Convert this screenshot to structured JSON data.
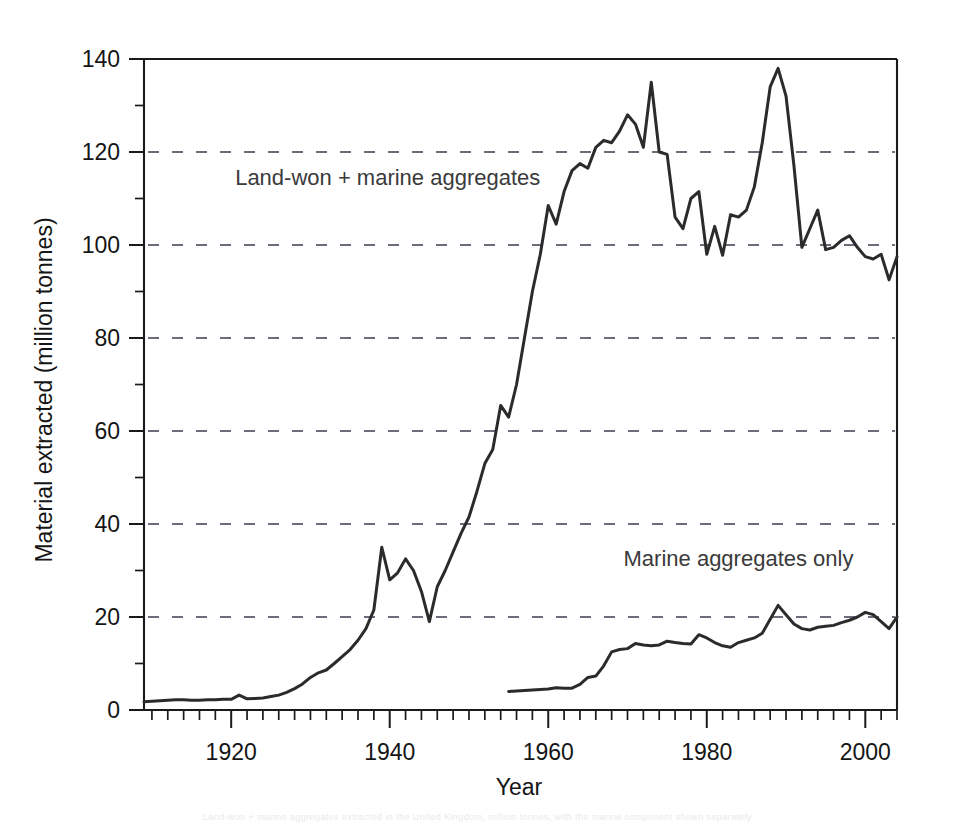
{
  "chart_data": {
    "type": "line",
    "title": "",
    "xlabel": "Year",
    "ylabel": "Material extracted (million tonnes)",
    "xlim": [
      1909,
      2004
    ],
    "ylim": [
      0,
      140
    ],
    "xticks": [
      1920,
      1940,
      1960,
      1980,
      2000
    ],
    "xtick_labels": [
      "1920",
      "1940",
      "1960",
      "1980",
      "2000"
    ],
    "xtick_minor_step": 2,
    "yticks": [
      0,
      20,
      40,
      60,
      80,
      100,
      120,
      140
    ],
    "ytick_labels": [
      "0",
      "20",
      "40",
      "60",
      "80",
      "100",
      "120",
      "140"
    ],
    "ytick_minor_step": 10,
    "grid": "horizontal-dashed",
    "gridlines_at": [
      20,
      40,
      60,
      80,
      100,
      120
    ],
    "legend": "inline-annotations",
    "annotations": [
      {
        "text": "Land-won + marine aggregates",
        "x": 1920.5,
        "y": 113
      },
      {
        "text": "Marine aggregates only",
        "x": 1969.5,
        "y": 31
      }
    ],
    "series": [
      {
        "name": "Land-won + marine aggregates",
        "color": "#2b2b2b",
        "x": [
          1909,
          1910,
          1911,
          1912,
          1913,
          1914,
          1915,
          1916,
          1917,
          1918,
          1919,
          1920,
          1921,
          1922,
          1923,
          1924,
          1925,
          1926,
          1927,
          1928,
          1929,
          1930,
          1931,
          1932,
          1933,
          1934,
          1935,
          1936,
          1937,
          1938,
          1939,
          1940,
          1941,
          1942,
          1943,
          1944,
          1945,
          1946,
          1947,
          1948,
          1949,
          1950,
          1951,
          1952,
          1953,
          1954,
          1955,
          1956,
          1957,
          1958,
          1959,
          1960,
          1961,
          1962,
          1963,
          1964,
          1965,
          1966,
          1967,
          1968,
          1969,
          1970,
          1971,
          1972,
          1973,
          1974,
          1975,
          1976,
          1977,
          1978,
          1979,
          1980,
          1981,
          1982,
          1983,
          1984,
          1985,
          1986,
          1987,
          1988,
          1989,
          1990,
          1991,
          1992,
          1993,
          1994,
          1995,
          1996,
          1997,
          1998,
          1999,
          2000,
          2001,
          2002,
          2003,
          2004
        ],
        "y": [
          1.8,
          1.9,
          2.0,
          2.1,
          2.2,
          2.2,
          2.1,
          2.1,
          2.2,
          2.2,
          2.3,
          2.3,
          3.2,
          2.4,
          2.5,
          2.6,
          2.9,
          3.2,
          3.8,
          4.6,
          5.6,
          7.0,
          8.0,
          8.6,
          10.0,
          11.5,
          13.0,
          15.0,
          17.5,
          21.5,
          35.0,
          28.0,
          29.5,
          32.5,
          30.0,
          25.5,
          19.0,
          26.5,
          30.0,
          34.0,
          38.0,
          41.5,
          47.0,
          53.0,
          56.0,
          65.5,
          63.0,
          70.0,
          80.0,
          90.0,
          98.0,
          108.5,
          104.5,
          111.5,
          116.0,
          117.5,
          116.5,
          121.0,
          122.5,
          122.0,
          124.5,
          128.0,
          126.0,
          121.0,
          135.0,
          120.0,
          119.5,
          106.0,
          103.5,
          110.0,
          111.5,
          98.0,
          104.0,
          97.8,
          106.5,
          106.0,
          107.5,
          112.5,
          122.0,
          134.0,
          138.0,
          132.0,
          117.0,
          99.5,
          103.5,
          107.5,
          99.0,
          99.5,
          101.0,
          102.0,
          99.5,
          97.5,
          97.0,
          98.0,
          92.5,
          97.5
        ]
      },
      {
        "name": "Marine aggregates only",
        "color": "#2b2b2b",
        "x": [
          1955,
          1956,
          1957,
          1958,
          1959,
          1960,
          1961,
          1962,
          1963,
          1964,
          1965,
          1966,
          1967,
          1968,
          1969,
          1970,
          1971,
          1972,
          1973,
          1974,
          1975,
          1976,
          1977,
          1978,
          1979,
          1980,
          1981,
          1982,
          1983,
          1984,
          1985,
          1986,
          1987,
          1988,
          1989,
          1990,
          1991,
          1992,
          1993,
          1994,
          1995,
          1996,
          1997,
          1998,
          1999,
          2000,
          2001,
          2002,
          2003,
          2004
        ],
        "y": [
          4.0,
          4.1,
          4.2,
          4.3,
          4.4,
          4.5,
          4.8,
          4.7,
          4.7,
          5.5,
          7.0,
          7.3,
          9.5,
          12.5,
          13.0,
          13.2,
          14.3,
          14.0,
          13.8,
          14.0,
          14.8,
          14.5,
          14.3,
          14.2,
          16.2,
          15.5,
          14.5,
          13.8,
          13.5,
          14.5,
          15.0,
          15.5,
          16.5,
          19.5,
          22.5,
          20.5,
          18.5,
          17.5,
          17.2,
          17.8,
          18.0,
          18.2,
          18.8,
          19.3,
          20.0,
          21.0,
          20.5,
          19.0,
          17.5,
          20.0
        ]
      }
    ]
  },
  "axis": {
    "x_title": "Year",
    "y_title": "Material extracted (million tonnes)"
  },
  "caption": {
    "ghost_line": "Land-won + marine aggregates extracted in the United Kingdom, million tonnes, with the marine component shown separately"
  }
}
